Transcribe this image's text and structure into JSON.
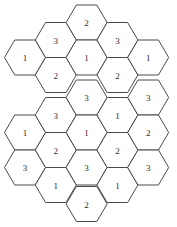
{
  "figure": {
    "type": "hexagonal-grid",
    "title": "",
    "orientation": "flat-top-pointy-side",
    "background_color": "#ffffff",
    "stroke_color": "#4a4a4a",
    "label_color": "#2b2b2b",
    "cell_count": 23,
    "geometry": {
      "hex_width": 41,
      "hex_height": 35,
      "column_step_x": 30.8,
      "row_step_y": 35,
      "column_offset_y": 17.5
    },
    "columns": [
      {
        "index": 1,
        "name": "column-left-outer",
        "x_center": 25,
        "y_start": 57.5,
        "cells": [
          {
            "id": "c1r1",
            "value": "1",
            "cx": 25,
            "cy": 57.5
          },
          {
            "id": "c1r2",
            "value": "1",
            "cx": 25,
            "cy": 132.5
          },
          {
            "id": "c1r3",
            "value": "3",
            "cx": 25,
            "cy": 167.5
          }
        ]
      },
      {
        "index": 2,
        "name": "column-left-inner",
        "x_center": 55.8,
        "cells": [
          {
            "id": "c2r1",
            "value": "3",
            "cx": 55.8,
            "cy": 40
          },
          {
            "id": "c2r2",
            "value": "2",
            "cx": 55.8,
            "cy": 75
          },
          {
            "id": "c2r3",
            "value": "3",
            "cx": 55.8,
            "cy": 115
          },
          {
            "id": "c2r4",
            "value": "2",
            "cx": 55.8,
            "cy": 150
          },
          {
            "id": "c2r5",
            "value": "1",
            "cx": 55.8,
            "cy": 185
          }
        ]
      },
      {
        "index": 3,
        "name": "column-center",
        "x_center": 86.6,
        "cells": [
          {
            "id": "c3r1",
            "value": "2",
            "cx": 86.6,
            "cy": 22.5
          },
          {
            "id": "c3r2",
            "value": "1",
            "cx": 86.6,
            "cy": 57.5
          },
          {
            "id": "c3r3",
            "value": "3",
            "cx": 86.6,
            "cy": 97.5
          },
          {
            "id": "c3r4",
            "value": "1",
            "cx": 86.6,
            "cy": 132.5
          },
          {
            "id": "c3r5",
            "value": "3",
            "cx": 86.6,
            "cy": 167.5
          },
          {
            "id": "c3r6",
            "value": "2",
            "cx": 86.6,
            "cy": 204
          }
        ]
      },
      {
        "index": 4,
        "name": "column-right-inner",
        "x_center": 117.4,
        "cells": [
          {
            "id": "c4r1",
            "value": "3",
            "cx": 117.4,
            "cy": 40
          },
          {
            "id": "c4r2",
            "value": "2",
            "cx": 117.4,
            "cy": 75
          },
          {
            "id": "c4r3",
            "value": "1",
            "cx": 117.4,
            "cy": 115
          },
          {
            "id": "c4r4",
            "value": "2",
            "cx": 117.4,
            "cy": 150
          },
          {
            "id": "c4r5",
            "value": "1",
            "cx": 117.4,
            "cy": 185
          }
        ]
      },
      {
        "index": 5,
        "name": "column-right-outer",
        "x_center": 148.2,
        "cells": [
          {
            "id": "c5r1",
            "value": "1",
            "cx": 148.2,
            "cy": 57.5
          },
          {
            "id": "c5r2",
            "value": "3",
            "cx": 148.2,
            "cy": 97.5
          },
          {
            "id": "c5r3",
            "value": "2",
            "cx": 148.2,
            "cy": 132.5
          },
          {
            "id": "c5r4",
            "value": "3",
            "cx": 148.2,
            "cy": 167.5
          }
        ]
      }
    ],
    "value_legend": [
      "1",
      "2",
      "3"
    ]
  }
}
